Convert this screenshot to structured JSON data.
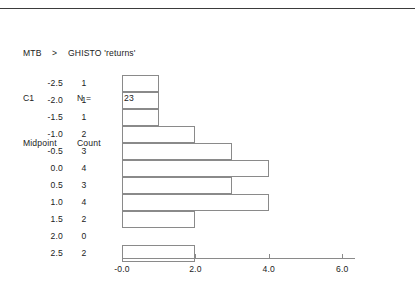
{
  "window": {
    "title": "Minitab session output"
  },
  "header": {
    "command_prompt": "MTB",
    "command_arrow": ">",
    "command": "GHISTO 'returns'",
    "column_label": "C1",
    "n_label": "N =",
    "n_value": "23",
    "midpoint_header": "Midpoint",
    "count_header": "Count"
  },
  "colors": {
    "rule": "#3b3b3b",
    "line": "#8a8a8a",
    "text": "#222222",
    "background": "#ffffff"
  },
  "chart_data": {
    "type": "bar",
    "orientation": "horizontal",
    "title": "",
    "subtitle": "",
    "xlabel": "",
    "ylabel": "",
    "categories": [
      "-2.5",
      "-2.0",
      "-1.5",
      "-1.0",
      "-0.5",
      "0.0",
      "0.5",
      "1.0",
      "1.5",
      "2.0",
      "2.5"
    ],
    "values": [
      1,
      1,
      1,
      2,
      3,
      4,
      3,
      4,
      2,
      0,
      2
    ],
    "series": [
      {
        "name": "Count",
        "values": [
          1,
          1,
          1,
          2,
          3,
          4,
          3,
          4,
          2,
          0,
          2
        ]
      }
    ],
    "xlim": [
      0,
      6.4
    ],
    "xticks": [
      0,
      2,
      4,
      6
    ],
    "xtick_labels": [
      "-0.0",
      "2.0",
      "4.0",
      "6.0"
    ],
    "grid": false,
    "legend": false,
    "n": 23,
    "column": "C1",
    "variable": "returns"
  },
  "rows": [
    {
      "midpoint": "-2.5",
      "count": "1",
      "value": 1
    },
    {
      "midpoint": "-2.0",
      "count": "1",
      "value": 1
    },
    {
      "midpoint": "-1.5",
      "count": "1",
      "value": 1
    },
    {
      "midpoint": "-1.0",
      "count": "2",
      "value": 2
    },
    {
      "midpoint": "-0.5",
      "count": "3",
      "value": 3
    },
    {
      "midpoint": "0.0",
      "count": "4",
      "value": 4
    },
    {
      "midpoint": "0.5",
      "count": "3",
      "value": 3
    },
    {
      "midpoint": "1.0",
      "count": "4",
      "value": 4
    },
    {
      "midpoint": "1.5",
      "count": "2",
      "value": 2
    },
    {
      "midpoint": "2.0",
      "count": "0",
      "value": 0
    },
    {
      "midpoint": "2.5",
      "count": "2",
      "value": 2
    }
  ],
  "axis": {
    "ticks": [
      {
        "label": "-0.0",
        "value": 0
      },
      {
        "label": "2.0",
        "value": 2
      },
      {
        "label": "4.0",
        "value": 4
      },
      {
        "label": "6.0",
        "value": 6
      }
    ]
  }
}
